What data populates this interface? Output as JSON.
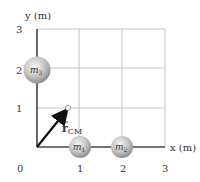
{
  "axes": {
    "x_label": "x (m)",
    "y_label": "y (m)",
    "x_ticks": [
      "0",
      "1",
      "2",
      "3"
    ],
    "y_ticks": [
      "1",
      "2",
      "3"
    ]
  },
  "masses": [
    {
      "id": "m1",
      "label": "m",
      "sub": "1",
      "x": 1,
      "y": 0
    },
    {
      "id": "m2",
      "label": "m",
      "sub": "2",
      "x": 2,
      "y": 0
    },
    {
      "id": "m3",
      "label": "m",
      "sub": "3",
      "x": 0,
      "y": 2
    }
  ],
  "vector": {
    "label": "r",
    "sub": "CM",
    "to_x": 0.75,
    "to_y": 1.0
  },
  "colors": {
    "grid": "#bfbfbf",
    "axis": "#555555",
    "vector": "#111111",
    "sphere": "#c8c8c8"
  }
}
